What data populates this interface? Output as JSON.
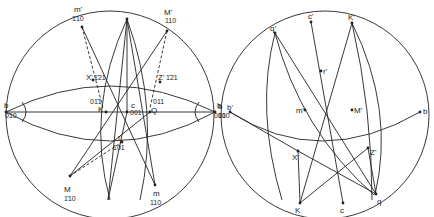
{
  "figure": {
    "left_projection": {
      "poles": {
        "m_prime": {
          "name": "m'",
          "index": "1̄10"
        },
        "M_prime": {
          "name": "M'",
          "index": "110"
        },
        "X_prime": {
          "name": "X'",
          "index": "1̄21"
        },
        "Z_prime": {
          "name": "Z'",
          "index": "1̄21"
        },
        "b_left": {
          "name": "b",
          "index": "010"
        },
        "b_right": {
          "name": "b",
          "index": "010"
        },
        "K": {
          "name": "K",
          "index": "01̄1"
        },
        "Q": {
          "name": "Q",
          "index": "011"
        },
        "c": {
          "name": "c",
          "index": "001"
        },
        "r": {
          "name": "r",
          "index": "101"
        },
        "M": {
          "name": "M",
          "index": "1̄10"
        },
        "m": {
          "name": "m",
          "index": "110"
        }
      }
    },
    "right_projection": {
      "poles": {
        "q_prime": "q'",
        "c_prime": "c'",
        "K_prime": "K'",
        "r_prime": "r'",
        "m_prime": "m'",
        "M_prime": "M'",
        "b_prime": "b'",
        "b_prime_index": "010",
        "b_left": "b",
        "b_right": "b",
        "X_prime": "X'",
        "Z_prime": "Z'",
        "K": "K",
        "c": "c",
        "q": "q"
      }
    }
  }
}
